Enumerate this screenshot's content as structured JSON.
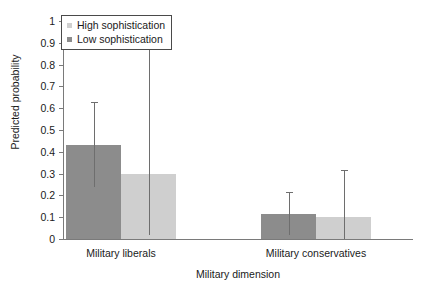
{
  "chart_data": {
    "type": "bar",
    "title": "",
    "xlabel": "Military dimension",
    "ylabel": "Predicted probability",
    "categories": [
      "Military liberals",
      "Military conservatives"
    ],
    "ylim": [
      0,
      1
    ],
    "ytick_labels": [
      "0",
      "0.1",
      "0.2",
      "0.3",
      "0.4",
      "0.5",
      "0.6",
      "0.7",
      "0.8",
      "0.9",
      "1"
    ],
    "ytick_values": [
      0,
      0.1,
      0.2,
      0.3,
      0.4,
      0.5,
      0.6,
      0.7,
      0.8,
      0.9,
      1
    ],
    "grid": false,
    "legend_position": "top-left",
    "series": [
      {
        "name": "Low sophistication",
        "color": "#8c8c8c",
        "values": [
          0.43,
          0.115
        ],
        "err_low": [
          0.24,
          0.02
        ],
        "err_high": [
          0.63,
          0.215
        ]
      },
      {
        "name": "High sophistication",
        "color": "#cfcfcf",
        "values": [
          0.3,
          0.1
        ],
        "err_low": [
          0.02,
          0.0
        ],
        "err_high": [
          0.9,
          0.315
        ]
      }
    ],
    "errorbar_color": "#6e6e6e",
    "axis_color": "#7a7a7a"
  },
  "legend": {
    "items": [
      {
        "label": "High sophistication",
        "color": "#cfcfcf"
      },
      {
        "label": "Low sophistication",
        "color": "#8c8c8c"
      }
    ]
  },
  "axes": {
    "y_title": "Predicted probability",
    "x_title": "Military dimension"
  }
}
